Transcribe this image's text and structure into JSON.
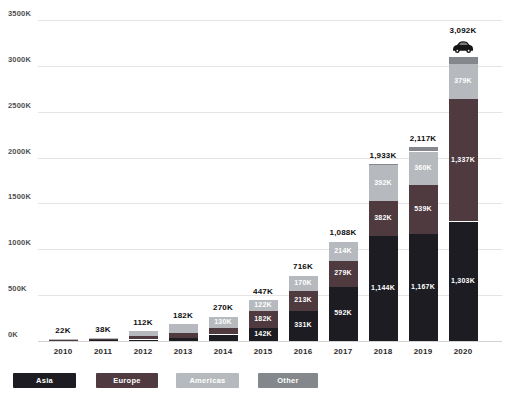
{
  "chart_data": {
    "type": "bar",
    "stacked": true,
    "title": "",
    "xlabel": "",
    "ylabel": "",
    "unit": "K",
    "categories": [
      "2010",
      "2011",
      "2012",
      "2013",
      "2014",
      "2015",
      "2016",
      "2017",
      "2018",
      "2019",
      "2020"
    ],
    "ylim": [
      0,
      3500
    ],
    "ytick_step": 500,
    "ytick_labels": [
      "0K",
      "500K",
      "1000K",
      "1500K",
      "2000K",
      "2500K",
      "3000K",
      "3500K"
    ],
    "grid": true,
    "legend_position": "bottom",
    "series": [
      {
        "name": "Asia",
        "color": "#1c1c22",
        "values": [
          8,
          10,
          16,
          33,
          70,
          142,
          331,
          592,
          1144,
          1167,
          1303
        ],
        "bar_labels": [
          null,
          null,
          null,
          null,
          null,
          "142K",
          "331K",
          "592K",
          "1,144K",
          "1,167K",
          "1,303K"
        ]
      },
      {
        "name": "Europe",
        "color": "#4e3a3f",
        "values": [
          6,
          11,
          35,
          52,
          67,
          182,
          213,
          279,
          382,
          539,
          1337
        ],
        "bar_labels": [
          null,
          null,
          null,
          null,
          null,
          "182K",
          "213K",
          "279K",
          "382K",
          "539K",
          "1,337K"
        ]
      },
      {
        "name": "Americas",
        "color": "#b6babe",
        "values": [
          7,
          16,
          60,
          96,
          130,
          122,
          170,
          214,
          392,
          360,
          379
        ],
        "bar_labels": [
          null,
          null,
          null,
          null,
          "130K",
          "122K",
          "170K",
          "214K",
          "392K",
          "360K",
          "379K"
        ]
      },
      {
        "name": "Other",
        "color": "#84888c",
        "values": [
          1,
          1,
          1,
          1,
          3,
          1,
          2,
          3,
          15,
          51,
          73
        ],
        "bar_labels": [
          null,
          null,
          null,
          null,
          null,
          null,
          null,
          null,
          null,
          null,
          null
        ]
      }
    ],
    "totals": [
      "22K",
      "38K",
      "112K",
      "182K",
      "270K",
      "447K",
      "716K",
      "1,088K",
      "1,933K",
      "2,117K",
      "3,092K"
    ],
    "annotations": [
      {
        "type": "car-icon",
        "category": "2020",
        "color": "#151515"
      }
    ]
  },
  "legend": {
    "items": [
      {
        "label": "Asia",
        "color": "#1c1c22"
      },
      {
        "label": "Europe",
        "color": "#4e3a3f"
      },
      {
        "label": "Americas",
        "color": "#b6babe"
      },
      {
        "label": "Other",
        "color": "#84888c"
      }
    ]
  },
  "colors": {
    "background": "#ffffff",
    "gridline": "#e4e4e4",
    "baseline": "#d2d2d2",
    "axis_label": "#4f4f4f",
    "total_label": "#0d0d0d",
    "year_label": "#2a2a2a",
    "bar_label": "#ffffff"
  }
}
